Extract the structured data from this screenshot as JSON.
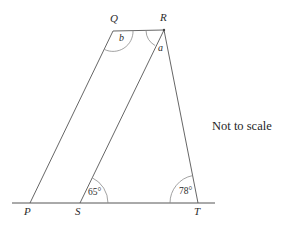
{
  "figure": {
    "type": "geometry-diagram",
    "note": "Not to scale",
    "stroke_color": "#555555",
    "label_color": "#2b2b2b",
    "background_color": "#ffffff",
    "points": {
      "P": {
        "label": "P",
        "x": 30,
        "y": 203
      },
      "S": {
        "label": "S",
        "x": 80,
        "y": 203
      },
      "T": {
        "label": "T",
        "x": 198,
        "y": 203
      },
      "Q": {
        "label": "Q",
        "x": 113,
        "y": 31
      },
      "R": {
        "label": "R",
        "x": 164,
        "y": 30
      }
    },
    "baseline": {
      "x1": 12,
      "y1": 203,
      "x2": 215,
      "y2": 203
    },
    "segments": [
      {
        "name": "PQ",
        "from": "P",
        "to": "Q"
      },
      {
        "name": "QR",
        "from": "Q",
        "to": "R"
      },
      {
        "name": "SR",
        "from": "S",
        "to": "R"
      },
      {
        "name": "RT",
        "from": "R",
        "to": "T"
      }
    ],
    "angles": [
      {
        "name": "angle-b-at-Q",
        "vertex": "Q",
        "label": "b",
        "value": "b"
      },
      {
        "name": "angle-a-at-R",
        "vertex": "R",
        "label": "a",
        "value": "a"
      },
      {
        "name": "angle-65-at-S",
        "vertex": "S",
        "label": "65°",
        "value": "65"
      },
      {
        "name": "angle-78-at-T",
        "vertex": "T",
        "label": "78°",
        "value": "78"
      }
    ]
  }
}
